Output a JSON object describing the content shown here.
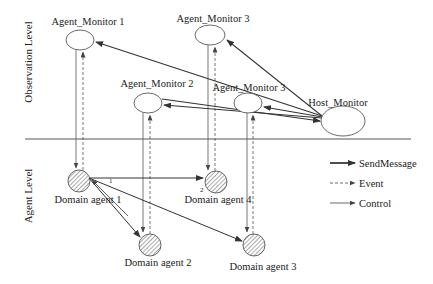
{
  "levels": {
    "observation": "Observation Level",
    "agent": "Agent Level"
  },
  "monitors": [
    {
      "id": "am1",
      "label": "Agent_Monitor 1",
      "cx": 80,
      "cy": 40,
      "rx": 14,
      "ry": 10,
      "lx": 88,
      "ly": 25
    },
    {
      "id": "am3_top",
      "label": "Agent_Monitor 3",
      "cx": 210,
      "cy": 35,
      "rx": 15,
      "ry": 10,
      "lx": 213,
      "ly": 22
    },
    {
      "id": "am2",
      "label": "Agent_Monitor 2",
      "cx": 148,
      "cy": 103,
      "rx": 14,
      "ry": 10,
      "lx": 157,
      "ly": 87
    },
    {
      "id": "am3_mid",
      "label": "Agent_Monitor 3",
      "cx": 248,
      "cy": 103,
      "rx": 14,
      "ry": 10,
      "lx": 249,
      "ly": 91
    },
    {
      "id": "host",
      "label": "Host_Monitor",
      "cx": 343,
      "cy": 121,
      "rx": 22,
      "ry": 15,
      "lx": 338,
      "ly": 106
    }
  ],
  "domain_agents": [
    {
      "id": "da1",
      "label": "Domain agent 1",
      "cx": 79,
      "cy": 181,
      "r": 11,
      "lx": 88,
      "ly": 203
    },
    {
      "id": "da4",
      "label": "Domain agent 4",
      "cx": 216,
      "cy": 182,
      "r": 11,
      "lx": 218,
      "ly": 203
    },
    {
      "id": "da2",
      "label": "Domain agent 2",
      "cx": 150,
      "cy": 245,
      "r": 11,
      "lx": 158,
      "ly": 266
    },
    {
      "id": "da3",
      "label": "Domain agent 3",
      "cx": 254,
      "cy": 245,
      "r": 11,
      "lx": 263,
      "ly": 270
    }
  ],
  "edge_labels": [
    {
      "text": "1",
      "x": 109,
      "y": 183
    },
    {
      "text": "2",
      "x": 200,
      "y": 192
    }
  ],
  "legend": [
    {
      "label": "SendMessage",
      "style": "bold"
    },
    {
      "label": "Event",
      "style": "dashed"
    },
    {
      "label": "Control",
      "style": "thin"
    }
  ],
  "colors": {
    "line": "#333333",
    "hatch": "#555555",
    "separator": "#444444"
  }
}
